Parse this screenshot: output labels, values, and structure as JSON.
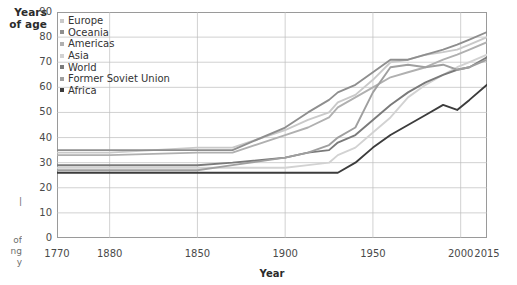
{
  "chart_data": {
    "type": "line",
    "title": "",
    "xlabel": "Year",
    "ylabel": "Years of age",
    "ylabel_line1": "Years",
    "ylabel_line2": "of age",
    "xlim": [
      1770,
      2015
    ],
    "ylim": [
      0,
      90
    ],
    "grid": true,
    "legend_position": "top-left inside plot",
    "yticks": [
      90,
      80,
      70,
      60,
      50,
      40,
      30,
      20,
      10,
      0
    ],
    "xticks": [
      {
        "value": 1770,
        "label": "1770"
      },
      {
        "value": 1800,
        "label": "1880"
      },
      {
        "value": 1850,
        "label": "1850"
      },
      {
        "value": 1900,
        "label": "1900"
      },
      {
        "value": 1950,
        "label": "1950"
      },
      {
        "value": 2000,
        "label": "2000"
      },
      {
        "value": 2015,
        "label": "2015"
      }
    ],
    "x": [
      1770,
      1800,
      1850,
      1870,
      1900,
      1913,
      1925,
      1930,
      1940,
      1950,
      1960,
      1970,
      1980,
      1990,
      1998,
      2005,
      2015
    ],
    "series": [
      {
        "name": "Europe",
        "color": "#c9c9c9",
        "values": [
          34,
          34,
          36,
          36,
          43,
          47,
          50,
          54,
          57,
          63,
          70,
          71,
          73,
          74,
          75,
          77,
          80
        ]
      },
      {
        "name": "Oceania",
        "color": "#8e8e8e",
        "values": [
          35,
          35,
          35,
          35,
          44,
          50,
          55,
          58,
          61,
          66,
          71,
          71,
          73,
          75,
          77,
          79,
          82
        ]
      },
      {
        "name": "Americas",
        "color": "#b0b0b0",
        "values": [
          33,
          33,
          34,
          34,
          41,
          44,
          48,
          52,
          56,
          60,
          64,
          66,
          68,
          71,
          73,
          75,
          78
        ]
      },
      {
        "name": "Asia",
        "color": "#d2d2d2",
        "values": [
          28,
          28,
          28,
          28,
          28,
          29,
          30,
          33,
          36,
          42,
          48,
          56,
          61,
          65,
          68,
          70,
          73
        ]
      },
      {
        "name": "World",
        "color": "#7a7a7a",
        "values": [
          29,
          29,
          29,
          30,
          32,
          34,
          35,
          38,
          41,
          47,
          53,
          58,
          62,
          65,
          67,
          68,
          72
        ]
      },
      {
        "name": "Former Soviet Union",
        "color": "#9f9f9f",
        "values": [
          27,
          27,
          27,
          29,
          32,
          34,
          37,
          40,
          44,
          58,
          68,
          69,
          68,
          69,
          67,
          68,
          71
        ]
      },
      {
        "name": "Africa",
        "color": "#3c3c3c",
        "values": [
          26,
          26,
          26,
          26,
          26,
          26,
          26,
          26,
          30,
          36,
          41,
          45,
          49,
          53,
          51,
          55,
          61
        ]
      }
    ],
    "legend": [
      "Europe",
      "Oceania",
      "Americas",
      "Asia",
      "World",
      "Former Soviet Union",
      "Africa"
    ]
  },
  "margin_text": {
    "line1": "|",
    "line2": "of",
    "line3": "ng",
    "line4": "y"
  }
}
